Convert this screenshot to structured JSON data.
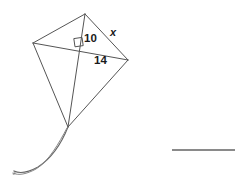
{
  "figure": {
    "name": "kite-with-diagonals",
    "background_color": "#ffffff",
    "stroke_color": "#555555",
    "stroke_color_light": "#777777",
    "label_color": "#1a1a1a",
    "vertices": {
      "top": {
        "x": 85,
        "y": 14
      },
      "left": {
        "x": 33,
        "y": 43
      },
      "right": {
        "x": 128,
        "y": 60
      },
      "bottom": {
        "x": 68,
        "y": 127
      }
    },
    "diagonal_intersection": {
      "x": 79.5,
      "y": 45.5
    },
    "right_angle_marker": {
      "x": 73,
      "y": 38,
      "size": 8,
      "label": "right-angle-90-degrees"
    },
    "tail": {
      "start": {
        "x": 68,
        "y": 127
      },
      "end": {
        "x": 14,
        "y": 173
      },
      "style": "double-curve-with-hook"
    },
    "labels": [
      {
        "id": "side-10",
        "text": "10",
        "segment": "top-vertex-to-intersection",
        "x": 84,
        "y": 33
      },
      {
        "id": "side-14",
        "text": "14",
        "segment": "intersection-to-right-vertex",
        "x": 94,
        "y": 55
      },
      {
        "id": "side-x",
        "text": "x",
        "segment": "top-vertex-to-right-vertex-hypotenuse",
        "x": 110,
        "y": 27,
        "italic": true
      }
    ]
  },
  "answer_line": {
    "name": "answer-blank-line",
    "x1": 172,
    "y1": 150,
    "x2": 235,
    "y2": 150,
    "color": "#8a8a8a",
    "thickness": 2
  }
}
